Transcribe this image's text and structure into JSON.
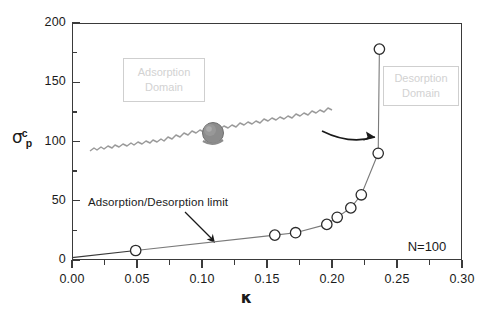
{
  "chart_data": {
    "type": "scatter",
    "title": "",
    "xlabel": "κ",
    "ylabel": "σ",
    "ylabel_sub": "p",
    "ylabel_sup": "c",
    "xlim": [
      0.0,
      0.3
    ],
    "ylim": [
      0,
      200
    ],
    "grid": false,
    "legend": "none",
    "xticks": [
      "0.00",
      "0.05",
      "0.10",
      "0.15",
      "0.20",
      "0.25",
      "0.30"
    ],
    "xtick_values": [
      0.0,
      0.05,
      0.1,
      0.15,
      0.2,
      0.25,
      0.3
    ],
    "xminor_values": [
      0.025,
      0.075,
      0.125,
      0.175,
      0.225,
      0.275
    ],
    "yticks": [
      "0",
      "50",
      "100",
      "150",
      "200"
    ],
    "ytick_values": [
      0,
      50,
      100,
      150,
      200
    ],
    "yminor_values": [
      25,
      75,
      125,
      175
    ],
    "series": [
      {
        "name": "Adsorption/Desorption limit",
        "marker": "open-circle",
        "x": [
          0.049,
          0.156,
          0.172,
          0.196,
          0.204,
          0.2145,
          0.2225,
          0.2355,
          0.2365
        ],
        "y": [
          8,
          21,
          23,
          30,
          36,
          44,
          55,
          90,
          178
        ]
      }
    ],
    "annotations": [
      {
        "name": "limit-annotation",
        "text": "Adsorption/Desorption limit",
        "x": 0.042,
        "y": 62
      },
      {
        "name": "adsorption-domain",
        "line1": "Adsorption",
        "line2": "Domain"
      },
      {
        "name": "desorption-domain",
        "line1": "Desorption",
        "line2": "Domain"
      },
      {
        "name": "n-label",
        "text": "N=100"
      }
    ],
    "colors": {
      "axis": "#3a3a3a",
      "marker_stroke": "#2b2b2b",
      "marker_fill": "#ffffff",
      "connector": "#7a7a7a",
      "domain_text": "#d2d2d2",
      "domain_border": "#cfcfcf",
      "chain": "#9a9a9a",
      "particle": "#8a8a8a"
    }
  },
  "axes": {
    "y_ticks": [
      {
        "label": "200",
        "value": 200
      },
      {
        "label": "150",
        "value": 150
      },
      {
        "label": "100",
        "value": 100
      },
      {
        "label": "50",
        "value": 50
      },
      {
        "label": "0",
        "value": 0
      }
    ],
    "x_ticks": [
      {
        "label": "0.00",
        "value": 0.0
      },
      {
        "label": "0.05",
        "value": 0.05
      },
      {
        "label": "0.10",
        "value": 0.1
      },
      {
        "label": "0.15",
        "value": 0.15
      },
      {
        "label": "0.20",
        "value": 0.2
      },
      {
        "label": "0.25",
        "value": 0.25
      },
      {
        "label": "0.30",
        "value": 0.3
      }
    ]
  },
  "labels": {
    "xaxis_title": "κ",
    "yaxis_sigma": "σ",
    "yaxis_sub": "p",
    "yaxis_sup": "c",
    "adsorption_line1": "Adsorption",
    "adsorption_line2": "Domain",
    "desorption_line1": "Desorption",
    "desorption_line2": "Domain",
    "n_value": "N=100",
    "limit_annotation": "Adsorption/Desorption limit"
  }
}
